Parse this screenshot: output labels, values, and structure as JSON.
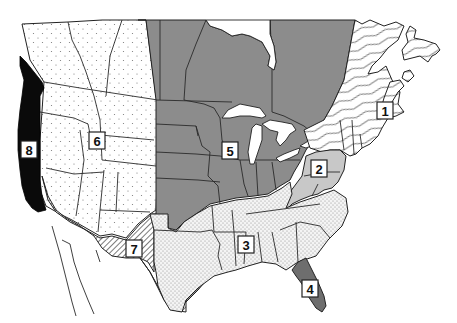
{
  "map": {
    "subject": "North America regional map",
    "regions": [
      {
        "id": 1,
        "label": "1",
        "name": "Northeast",
        "pattern": "wavy-lines",
        "label_pos": [
          385,
          111
        ]
      },
      {
        "id": 2,
        "label": "2",
        "name": "Mid-Atlantic / Appalachian",
        "pattern": "light-gray",
        "label_pos": [
          319,
          168
        ]
      },
      {
        "id": 3,
        "label": "3",
        "name": "Southeast",
        "pattern": "fine-dots",
        "label_pos": [
          246,
          244
        ]
      },
      {
        "id": 4,
        "label": "4",
        "name": "Florida",
        "pattern": "dark-gray",
        "label_pos": [
          310,
          288
        ]
      },
      {
        "id": 5,
        "label": "5",
        "name": "Midwest / Central",
        "pattern": "medium-gray",
        "label_pos": [
          230,
          150
        ]
      },
      {
        "id": 6,
        "label": "6",
        "name": "Interior West",
        "pattern": "sparse-dots",
        "label_pos": [
          97,
          140
        ]
      },
      {
        "id": 7,
        "label": "7",
        "name": "Southwest",
        "pattern": "diagonal-hatch",
        "label_pos": [
          134,
          248
        ]
      },
      {
        "id": 8,
        "label": "8",
        "name": "Pacific Coast",
        "pattern": "solid-black",
        "label_pos": [
          29,
          149
        ]
      }
    ]
  },
  "colors": {
    "background": "#ffffff",
    "region_5_fill": "#8c8c8c",
    "region_2_fill": "#c8c8c8",
    "region_4_fill": "#6e6e6e",
    "region_8_fill": "#0a0a0a",
    "border": "#2a2a2a"
  }
}
